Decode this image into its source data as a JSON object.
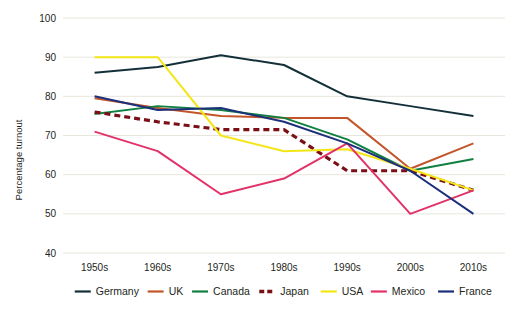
{
  "chart_data": {
    "type": "line",
    "title": "",
    "xlabel": "",
    "ylabel": "Percentage turnout",
    "categories": [
      "1950s",
      "1960s",
      "1970s",
      "1980s",
      "1990s",
      "2000s",
      "2010s"
    ],
    "ylim": [
      40,
      100
    ],
    "yticks": [
      40,
      50,
      60,
      70,
      80,
      90,
      100
    ],
    "grid": "horizontal",
    "legend_position": "bottom",
    "series": [
      {
        "name": "Germany",
        "color": "#13303a",
        "dash": false,
        "values": [
          86,
          87.5,
          90.5,
          88,
          80,
          77.5,
          75
        ]
      },
      {
        "name": "UK",
        "color": "#c2562a",
        "dash": false,
        "values": [
          79.5,
          77,
          75,
          74.5,
          74.5,
          61.5,
          68
        ]
      },
      {
        "name": "Canada",
        "color": "#0f8040",
        "dash": false,
        "values": [
          75.5,
          77.5,
          76.5,
          74.5,
          69,
          61,
          64
        ]
      },
      {
        "name": "Japan",
        "color": "#7a0f15",
        "dash": true,
        "values": [
          76,
          73.5,
          71.5,
          71.5,
          61,
          61,
          56
        ]
      },
      {
        "name": "USA",
        "color": "#f4e616",
        "dash": false,
        "values": [
          90,
          90,
          70,
          66,
          66.5,
          61.5,
          56
        ]
      },
      {
        "name": "Mexico",
        "color": "#e23268",
        "dash": false,
        "values": [
          71,
          66,
          55,
          59,
          68,
          50,
          56
        ]
      },
      {
        "name": "France",
        "color": "#1c2f7a",
        "dash": false,
        "values": [
          80,
          76.5,
          77,
          73.5,
          68,
          61,
          50
        ]
      }
    ]
  },
  "axes": {
    "y_label": "Percentage turnout",
    "y_tick_labels": [
      "100",
      "90",
      "80",
      "70",
      "60",
      "50",
      "40"
    ],
    "x_tick_labels": [
      "1950s",
      "1960s",
      "1970s",
      "1980s",
      "1990s",
      "2000s",
      "2010s"
    ]
  },
  "legend": {
    "items": [
      {
        "label": "Germany"
      },
      {
        "label": "UK"
      },
      {
        "label": "Canada"
      },
      {
        "label": "Japan"
      },
      {
        "label": "USA"
      },
      {
        "label": "Mexico"
      },
      {
        "label": "France"
      }
    ]
  }
}
